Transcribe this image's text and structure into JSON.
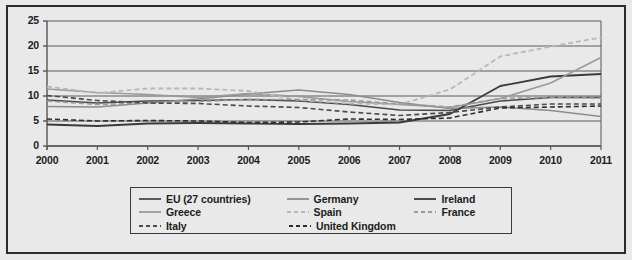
{
  "chart_data": {
    "type": "line",
    "title": "",
    "xlabel": "",
    "ylabel": "",
    "x": [
      2000,
      2001,
      2002,
      2003,
      2004,
      2005,
      2006,
      2007,
      2008,
      2009,
      2010,
      2011
    ],
    "xtick_labels": [
      "2000",
      "2001",
      "2002",
      "2003",
      "2004",
      "2005",
      "2006",
      "2007",
      "2008",
      "2009",
      "2010",
      "2011"
    ],
    "ytick_labels": [
      "0",
      "5",
      "10",
      "15",
      "20",
      "25"
    ],
    "yticks": [
      0,
      5,
      10,
      15,
      20,
      25
    ],
    "ylim": [
      0,
      25
    ],
    "xlim": [
      2000,
      2011
    ],
    "grid": "horizontal",
    "legend_position": "below-plot",
    "series": [
      {
        "name": "EU (27 countries)",
        "color": "#4a4a4a",
        "style": "solid",
        "width": 1.6,
        "values": [
          9.2,
          8.6,
          9.0,
          9.1,
          9.3,
          9.0,
          8.3,
          7.2,
          7.1,
          9.0,
          9.7,
          9.7
        ]
      },
      {
        "name": "Germany",
        "color": "#8c8c8c",
        "style": "solid",
        "width": 1.6,
        "values": [
          7.9,
          7.8,
          8.6,
          9.4,
          10.4,
          11.2,
          10.3,
          8.7,
          7.5,
          7.8,
          7.1,
          5.9
        ]
      },
      {
        "name": "Ireland",
        "color": "#3a3a3a",
        "style": "solid",
        "width": 1.8,
        "values": [
          4.3,
          4.0,
          4.5,
          4.6,
          4.5,
          4.4,
          4.5,
          4.7,
          6.4,
          12.0,
          13.9,
          14.4
        ]
      },
      {
        "name": "Greece",
        "color": "#9a9a9a",
        "style": "solid",
        "width": 1.6,
        "values": [
          11.4,
          10.7,
          10.3,
          9.7,
          10.5,
          9.9,
          8.9,
          8.3,
          7.7,
          9.5,
          12.6,
          17.7
        ]
      },
      {
        "name": "Spain",
        "color": "#b8b8b8",
        "style": "dashed",
        "width": 1.8,
        "values": [
          11.9,
          10.6,
          11.5,
          11.5,
          11.0,
          9.2,
          8.5,
          8.3,
          11.3,
          17.9,
          19.9,
          21.7
        ]
      },
      {
        "name": "France",
        "color": "#9a9a9a",
        "style": "dashed",
        "width": 1.6,
        "values": [
          9.0,
          8.3,
          8.6,
          8.9,
          9.3,
          9.3,
          9.2,
          8.4,
          7.8,
          9.5,
          9.7,
          9.6
        ]
      },
      {
        "name": "Italy",
        "color": "#4a4a4a",
        "style": "dashed",
        "width": 1.6,
        "values": [
          10.1,
          9.1,
          8.6,
          8.5,
          8.0,
          7.7,
          6.8,
          6.1,
          6.7,
          7.8,
          8.4,
          8.4
        ]
      },
      {
        "name": "United Kingdom",
        "color": "#2e2e2e",
        "style": "dashed",
        "width": 1.6,
        "values": [
          5.4,
          5.0,
          5.1,
          5.0,
          4.7,
          4.8,
          5.4,
          5.3,
          5.6,
          7.6,
          7.8,
          8.0
        ]
      }
    ]
  },
  "legend": {
    "rows": [
      [
        {
          "label": "EU (27 countries)",
          "color": "#4a4a4a",
          "style": "solid"
        },
        {
          "label": "Germany",
          "color": "#8c8c8c",
          "style": "solid"
        },
        {
          "label": "Ireland",
          "color": "#3a3a3a",
          "style": "solid"
        }
      ],
      [
        {
          "label": "Greece",
          "color": "#9a9a9a",
          "style": "solid"
        },
        {
          "label": "Spain",
          "color": "#b8b8b8",
          "style": "dashed"
        },
        {
          "label": "France",
          "color": "#9a9a9a",
          "style": "dashed"
        }
      ],
      [
        {
          "label": "Italy",
          "color": "#4a4a4a",
          "style": "dashed"
        },
        {
          "label": "United Kingdom",
          "color": "#2e2e2e",
          "style": "dashed"
        }
      ]
    ]
  },
  "style": {
    "background": "#e9e9e9",
    "frame_color": "#2b2b2b",
    "axis_color": "#555555",
    "gridline_color": "#5a5a5a",
    "text_color": "#1c1c1c"
  }
}
